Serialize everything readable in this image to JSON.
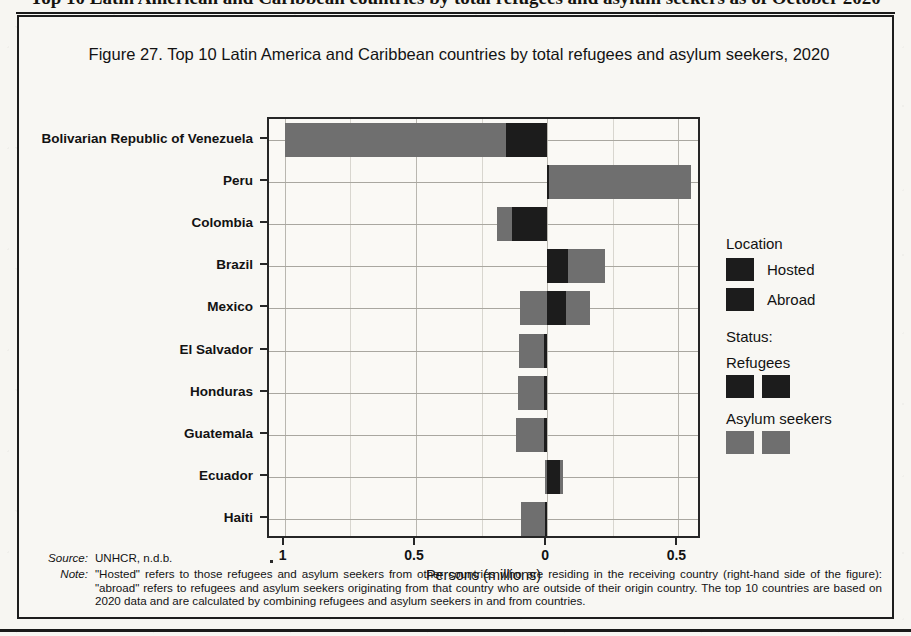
{
  "page_header": "Top 10 Latin American and Caribbean countries by total refugees and asylum seekers as of October 2020",
  "figure": {
    "title": "Figure 27. Top 10 Latin America and Caribbean countries by total refugees and asylum seekers, 2020"
  },
  "legend": {
    "location_title": "Location",
    "hosted_label": "Hosted",
    "abroad_label": "Abroad",
    "status_title": "Status:",
    "refugees_label": "Refugees",
    "asylum_label": "Asylum seekers"
  },
  "notes": {
    "source_key": "Source:",
    "source_value": "UNHCR, n.d.b.",
    "note_key": "Note:",
    "note_value": "\"Hosted\" refers to those refugees and asylum seekers from other countries who are residing in the receiving country (right-hand side of the figure): \"abroad\" refers to refugees and asylum seekers originating from that country who are outside of their origin country. The top 10 countries are based on 2020 data and are calculated by combining refugees and asylum seekers in and from countries."
  },
  "colors": {
    "refugees": "#1c1c1c",
    "asylum_seekers": "#6f6f6f",
    "frame": "#262626",
    "grid": "#b9b7b0",
    "background": "#f8f7f3"
  },
  "chart_data": {
    "type": "bar",
    "orientation": "horizontal-diverging",
    "title": "Figure 27. Top 10 Latin America and Caribbean countries by total refugees and asylum seekers, 2020",
    "xlabel": "Persons (millions)",
    "ylabel": "",
    "xlim": [
      -1.06,
      0.59
    ],
    "xticks": [
      -1,
      -0.5,
      0,
      0.5
    ],
    "xtick_labels": [
      "1",
      "0.5",
      "0",
      "0.5"
    ],
    "grid": true,
    "legend_position": "right",
    "note_axis": "Values left of zero are 'Abroad'; values right of zero are 'Hosted'. Magnitudes in millions of persons.",
    "categories": [
      "Bolivarian Republic of Venezuela",
      "Peru",
      "Colombia",
      "Brazil",
      "Mexico",
      "El Salvador",
      "Honduras",
      "Guatemala",
      "Ecuador",
      "Haiti"
    ],
    "series": [
      {
        "name": "Asylum seekers abroad",
        "side": "left",
        "color": "#6f6f6f",
        "values": [
          0.845,
          0.0,
          0.055,
          0.0,
          0.105,
          0.095,
          0.1,
          0.105,
          0.01,
          0.09
        ]
      },
      {
        "name": "Refugees abroad",
        "side": "left",
        "color": "#1c1c1c",
        "values": [
          0.155,
          0.0,
          0.135,
          0.0,
          0.0,
          0.012,
          0.012,
          0.012,
          0.0,
          0.008
        ]
      },
      {
        "name": "Refugees hosted",
        "side": "right",
        "color": "#1c1c1c",
        "values": [
          0.0,
          0.008,
          0.0,
          0.08,
          0.07,
          0.0,
          0.0,
          0.0,
          0.05,
          0.0
        ]
      },
      {
        "name": "Asylum seekers hosted",
        "side": "right",
        "color": "#6f6f6f",
        "values": [
          0.0,
          0.54,
          0.0,
          0.14,
          0.095,
          0.0,
          0.0,
          0.0,
          0.012,
          0.0
        ]
      }
    ],
    "row_totals_left": [
      1.0,
      0.0,
      0.19,
      0.0,
      0.105,
      0.107,
      0.112,
      0.117,
      0.01,
      0.098
    ],
    "row_totals_right": [
      0.0,
      0.548,
      0.0,
      0.22,
      0.165,
      0.0,
      0.0,
      0.0,
      0.062,
      0.0
    ]
  }
}
